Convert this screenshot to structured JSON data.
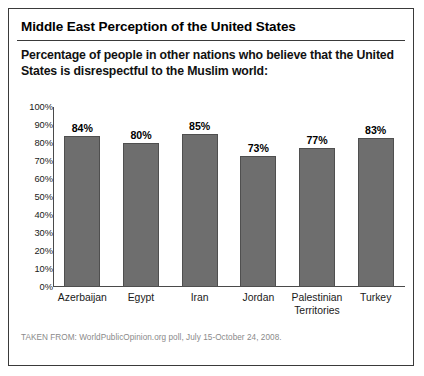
{
  "title": "Middle East Perception of the United States",
  "subtitle": "Percentage of people in other nations who believe that the United States is disrespectful to the Muslim world:",
  "footer": "TAKEN FROM: WorldPublicOpinion.org poll, July 15-October 24, 2008.",
  "colors": {
    "bar_fill": "#6e6e6e",
    "bar_stroke": "#4f4f4f",
    "axis": "#4a4a4a",
    "border": "#3a3a3a",
    "footer_text": "#8a8a8a"
  },
  "chart_data": {
    "type": "bar",
    "title": "Middle East Perception of the United States",
    "subtitle": "Percentage of people in other nations who believe that the United States is disrespectful to the Muslim world:",
    "categories": [
      "Azerbaijan",
      "Egypt",
      "Iran",
      "Jordan",
      "Palestinian Territories",
      "Turkey"
    ],
    "values": [
      84,
      80,
      85,
      73,
      77,
      83
    ],
    "value_labels": [
      "84%",
      "80%",
      "85%",
      "73%",
      "77%",
      "83%"
    ],
    "xlabel": "",
    "ylabel": "",
    "ylim": [
      0,
      100
    ],
    "ytick_labels": [
      "100%",
      "90%",
      "80%",
      "70%",
      "60%",
      "50%",
      "40%",
      "30%",
      "20%",
      "10%",
      "0%"
    ],
    "ytick_values": [
      100,
      90,
      80,
      70,
      60,
      50,
      40,
      30,
      20,
      10,
      0
    ],
    "grid": false,
    "legend": false
  }
}
